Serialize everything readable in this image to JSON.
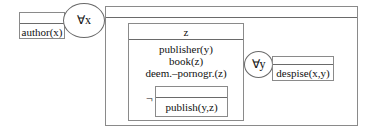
{
  "diagram": {
    "type": "discourse-representation-structure",
    "left_box": {
      "universe": "",
      "conditions": [
        "author(x)"
      ]
    },
    "quantifier_x": {
      "label": "∀x"
    },
    "outer_box": {
      "universe": "",
      "antecedent_box": {
        "universe": "z",
        "conditions": [
          "publisher(y)",
          "book(z)",
          "deem.–pornogr.(z)"
        ],
        "negation": {
          "symbol": "¬",
          "box": {
            "universe": "",
            "conditions": [
              "publish(y,z)"
            ]
          }
        }
      },
      "quantifier_y": {
        "label": "∀y"
      },
      "consequent_box": {
        "universe": "",
        "conditions": [
          "despise(x,y)"
        ]
      }
    }
  }
}
